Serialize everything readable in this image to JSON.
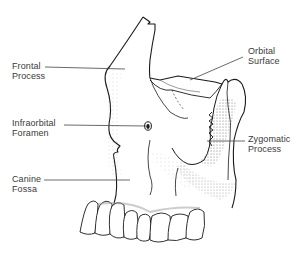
{
  "diagram": {
    "labels": [
      {
        "id": "frontal-process",
        "line1": "Frontal",
        "line2": "Process"
      },
      {
        "id": "infraorbital-foramen",
        "line1": "Infraorbital",
        "line2": "Foramen"
      },
      {
        "id": "canine-fossa",
        "line1": "Canine",
        "line2": "Fossa"
      },
      {
        "id": "orbital-surface",
        "line1": "Orbital",
        "line2": "Surface"
      },
      {
        "id": "zygomatic-process",
        "line1": "Zygomatic",
        "line2": "Process"
      }
    ],
    "colors": {
      "ink": "#1a1a1a",
      "label_text": "#3a3a3a",
      "leader_line": "#444444",
      "shading": "#8a8a8a",
      "background": "#ffffff"
    }
  }
}
